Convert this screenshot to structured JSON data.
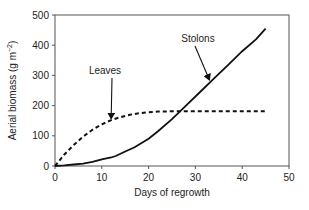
{
  "chart_data": {
    "type": "line",
    "title": "",
    "xlabel": "Days of regrowth",
    "ylabel": "Aerial biomass (g m⁻²)",
    "xlim": [
      0,
      50
    ],
    "ylim": [
      0,
      500
    ],
    "xticks": [
      0,
      10,
      20,
      30,
      40,
      50
    ],
    "yticks": [
      0,
      100,
      200,
      300,
      400,
      500
    ],
    "grid": false,
    "legend": "annotations",
    "series": [
      {
        "name": "Leaves",
        "style": "dashed",
        "x": [
          0,
          2,
          4,
          6,
          8,
          10,
          12,
          14,
          16,
          18,
          20,
          22,
          25,
          30,
          35,
          40,
          45
        ],
        "y": [
          0,
          38,
          70,
          97,
          120,
          138,
          152,
          162,
          170,
          175,
          178,
          180,
          181,
          181,
          181,
          181,
          181
        ]
      },
      {
        "name": "Stolons",
        "style": "solid",
        "x": [
          0,
          2,
          4,
          6,
          8,
          10,
          12,
          13,
          15,
          17,
          20,
          22,
          25,
          28,
          31,
          34,
          37,
          40,
          43,
          45
        ],
        "y": [
          0,
          2,
          5,
          8,
          14,
          22,
          28,
          33,
          48,
          62,
          90,
          115,
          155,
          200,
          245,
          290,
          335,
          380,
          420,
          455
        ]
      }
    ],
    "annotations": [
      {
        "label": "Leaves",
        "series": "Leaves",
        "arrow_to": [
          12,
          150
        ]
      },
      {
        "label": "Stolons",
        "series": "Stolons",
        "arrow_to": [
          33,
          278
        ]
      }
    ]
  }
}
